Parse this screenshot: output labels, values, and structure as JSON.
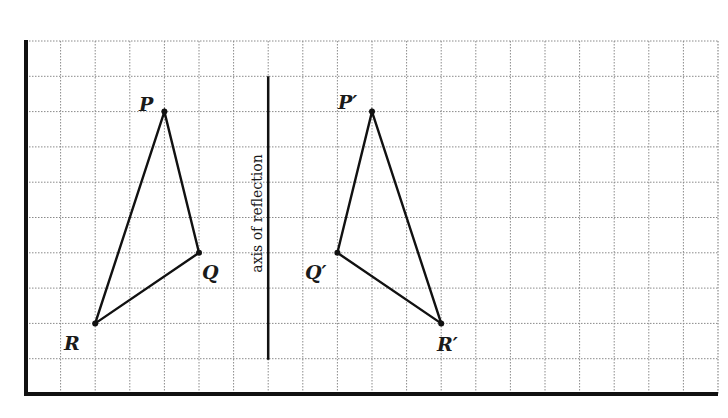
{
  "diagram": {
    "grid": {
      "origin_x": 26,
      "origin_y": 41,
      "cell_w": 34.6,
      "cell_h": 35.3,
      "cols": 20,
      "rows": 10,
      "line_color": "#8a8a8a",
      "border_color": "#111111"
    },
    "axis": {
      "label": "axis of reflection",
      "grid_col": 7,
      "from_row": 1,
      "to_row": 9
    },
    "original": {
      "points": [
        {
          "name": "P",
          "label": "P",
          "col": 4,
          "row": 2
        },
        {
          "name": "Q",
          "label": "Q",
          "col": 5,
          "row": 6
        },
        {
          "name": "R",
          "label": "R",
          "col": 2,
          "row": 8
        }
      ]
    },
    "image": {
      "points": [
        {
          "name": "P-prime",
          "label": "P′",
          "col": 10,
          "row": 2
        },
        {
          "name": "Q-prime",
          "label": "Q′",
          "col": 9,
          "row": 6
        },
        {
          "name": "R-prime",
          "label": "R′",
          "col": 12,
          "row": 8
        }
      ]
    },
    "labels": {
      "P": "P",
      "Q": "Q",
      "R": "R",
      "P_prime": "P′",
      "Q_prime": "Q′",
      "R_prime": "R′",
      "axis": "axis of reflection"
    }
  }
}
